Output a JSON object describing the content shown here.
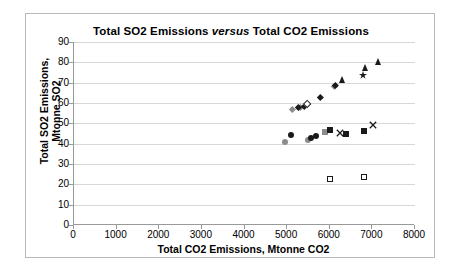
{
  "chart_data": {
    "type": "scatter",
    "title": "Total SO2 Emissions versus Total CO2 Emissions",
    "title_plain": "Total SO2 Emissions ",
    "title_emphasis": "versus",
    "title_tail": " Total CO2 Emissions",
    "xlabel": "Total CO2 Emissions, Mtonne CO2",
    "ylabel_line1": "Total SO2 Emissions,",
    "ylabel_line2": "Mtonne SO2",
    "xlim": [
      0,
      8000
    ],
    "ylim": [
      0,
      90
    ],
    "xticks": [
      "0",
      "1000",
      "2000",
      "3000",
      "4000",
      "5000",
      "6000",
      "7000",
      "8000"
    ],
    "xtick_values": [
      0,
      1000,
      2000,
      3000,
      4000,
      5000,
      6000,
      7000,
      8000
    ],
    "yticks": [
      "0",
      "10",
      "20",
      "30",
      "40",
      "50",
      "60",
      "70",
      "80",
      "90"
    ],
    "ytick_values": [
      0,
      10,
      20,
      30,
      40,
      50,
      60,
      70,
      80,
      90
    ],
    "grid": "horizontal",
    "legend": "none",
    "colors": {
      "dark": "#1a1a1a",
      "gray": "#8c8c8c",
      "gridline": "#d7d7d7",
      "axis": "#9a9a9a",
      "border": "#b9b9b9",
      "background": "#ffffff"
    },
    "series": [
      {
        "name": "gray-circles",
        "marker": "circle",
        "fill": "#8c8c8c",
        "size": 6,
        "points": [
          {
            "x": 4950,
            "y": 41.0
          },
          {
            "x": 5480,
            "y": 42.0
          }
        ]
      },
      {
        "name": "black-circles",
        "marker": "circle",
        "fill": "#1a1a1a",
        "size": 6,
        "points": [
          {
            "x": 5080,
            "y": 44.4
          },
          {
            "x": 5560,
            "y": 42.8
          },
          {
            "x": 5680,
            "y": 43.6
          }
        ]
      },
      {
        "name": "gray-squares",
        "marker": "square",
        "fill": "#8c8c8c",
        "size": 6,
        "points": [
          {
            "x": 5900,
            "y": 45.9
          }
        ]
      },
      {
        "name": "black-squares",
        "marker": "square",
        "fill": "#1a1a1a",
        "size": 6,
        "points": [
          {
            "x": 6000,
            "y": 46.7
          },
          {
            "x": 6380,
            "y": 44.6
          },
          {
            "x": 6800,
            "y": 46.1
          }
        ]
      },
      {
        "name": "open-squares",
        "marker": "square-open",
        "fill": "#ffffff",
        "stroke": "#1a1a1a",
        "size": 6,
        "points": [
          {
            "x": 6010,
            "y": 22.6
          },
          {
            "x": 6800,
            "y": 23.8
          }
        ]
      },
      {
        "name": "x-markers",
        "marker": "x",
        "fill": "#1a1a1a",
        "size": 8,
        "points": [
          {
            "x": 6230,
            "y": 48.0
          },
          {
            "x": 7020,
            "y": 52.3
          }
        ]
      },
      {
        "name": "gray-diamonds",
        "marker": "diamond",
        "fill": "#8c8c8c",
        "size": 6,
        "points": [
          {
            "x": 5120,
            "y": 56.8
          },
          {
            "x": 5300,
            "y": 57.8
          },
          {
            "x": 6110,
            "y": 68.2
          }
        ]
      },
      {
        "name": "black-diamonds",
        "marker": "diamond",
        "fill": "#1a1a1a",
        "size": 6,
        "points": [
          {
            "x": 5270,
            "y": 58.1
          },
          {
            "x": 5400,
            "y": 58.6
          },
          {
            "x": 5780,
            "y": 62.9
          },
          {
            "x": 6140,
            "y": 68.5
          }
        ]
      },
      {
        "name": "open-diamonds",
        "marker": "diamond-open",
        "fill": "#ffffff",
        "stroke": "#1a1a1a",
        "size": 6,
        "points": [
          {
            "x": 5470,
            "y": 59.6
          }
        ]
      },
      {
        "name": "black-triangles",
        "marker": "triangle",
        "fill": "#1a1a1a",
        "size": 7,
        "points": [
          {
            "x": 6310,
            "y": 71.0
          },
          {
            "x": 6830,
            "y": 77.1
          },
          {
            "x": 7150,
            "y": 80.0
          }
        ]
      },
      {
        "name": "star-markers",
        "marker": "star",
        "fill": "#1a1a1a",
        "size": 8,
        "points": [
          {
            "x": 6790,
            "y": 76.9
          }
        ]
      }
    ]
  }
}
